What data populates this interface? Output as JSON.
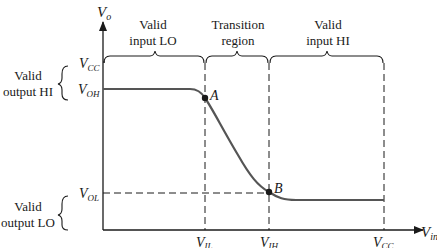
{
  "diagram": {
    "type": "voltage-transfer-characteristic",
    "axes": {
      "y_label": {
        "main": "V",
        "sub": "o"
      },
      "x_label": {
        "main": "V",
        "sub": "in"
      }
    },
    "y_levels": {
      "vcc": {
        "main": "V",
        "sub": "CC"
      },
      "voh": {
        "main": "V",
        "sub": "OH"
      },
      "vol": {
        "main": "V",
        "sub": "OL"
      }
    },
    "x_levels": {
      "vil": {
        "main": "V",
        "sub": "IL"
      },
      "vih": {
        "main": "V",
        "sub": "IH"
      },
      "vcc": {
        "main": "V",
        "sub": "CC"
      }
    },
    "regions": {
      "input_lo": {
        "line1": "Valid",
        "line2": "input LO"
      },
      "transition": {
        "line1": "Transition",
        "line2": "region"
      },
      "input_hi": {
        "line1": "Valid",
        "line2": "input HI"
      }
    },
    "output_regions": {
      "output_hi": {
        "line1": "Valid",
        "line2": "output HI"
      },
      "output_lo": {
        "line1": "Valid",
        "line2": "output LO"
      }
    },
    "points": {
      "a": "A",
      "b": "B"
    },
    "colors": {
      "ink": "#1a1a1a",
      "curve": "#555555"
    }
  }
}
